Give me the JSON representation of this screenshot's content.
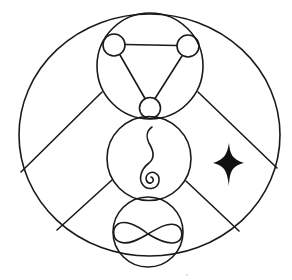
{
  "diagram": {
    "title": "",
    "colors": {
      "line": "#1a1a1a",
      "background": "#ffffff",
      "star": "#111111"
    },
    "elements": [
      {
        "id": "outer-circle",
        "type": "ellipse"
      },
      {
        "id": "top-circle",
        "type": "circle",
        "contains": "triangle-with-three-nodes"
      },
      {
        "id": "middle-circle",
        "type": "circle",
        "contains": "spiral-wave"
      },
      {
        "id": "bottom-circle",
        "type": "circle",
        "contains": "infinity-symbol"
      },
      {
        "id": "four-point-star",
        "type": "star"
      }
    ]
  }
}
